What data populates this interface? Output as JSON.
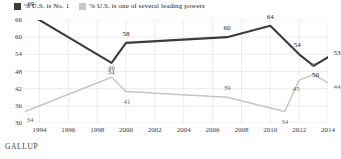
{
  "legend": {
    "position": "top-left",
    "items": [
      {
        "label": "% U.S. is No. 1",
        "color": "#3b3b3b",
        "swatch_name": "legend-swatch-dark"
      },
      {
        "label": "% U.S. is one of several leading powers",
        "color": "#cccccc",
        "swatch_name": "legend-swatch-light"
      }
    ]
  },
  "source": {
    "label": "GALLUP"
  },
  "chart_data": {
    "type": "line",
    "title": "",
    "subtitle": "",
    "xlabel": "",
    "ylabel": "",
    "xlim": [
      1993,
      2014
    ],
    "ylim": [
      30,
      66
    ],
    "yticks": [
      66,
      60,
      54,
      48,
      42,
      36,
      30
    ],
    "xticks": [
      1994,
      1996,
      1998,
      2000,
      2002,
      2004,
      2006,
      2008,
      2010,
      2012,
      2014
    ],
    "grid": true,
    "legend_position": "top-left",
    "series": [
      {
        "name": "% U.S. is No. 1",
        "color": "#3b3b3b",
        "x": [
          1993,
          1999,
          2000,
          2007,
          2010,
          2012,
          2013,
          2014
        ],
        "values": [
          69,
          51,
          58,
          60,
          64,
          54,
          50,
          53
        ],
        "labels": [
          "69",
          "51",
          "58",
          "60",
          "64",
          "54",
          "50",
          "53"
        ]
      },
      {
        "name": "% U.S. is one of several leading powers",
        "color": "#c6c6c6",
        "x": [
          1993,
          1999,
          2000,
          2007,
          2011,
          2012,
          2013,
          2014
        ],
        "values": [
          34,
          46,
          41,
          39,
          34,
          45,
          47,
          44
        ],
        "labels": [
          "34",
          "46",
          "41",
          "39",
          "34",
          "45",
          "47",
          "44"
        ]
      }
    ]
  }
}
